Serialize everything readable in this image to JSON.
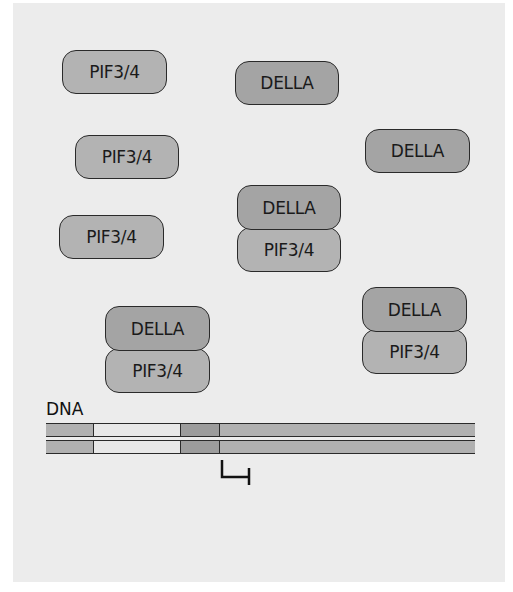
{
  "diagram": {
    "colors": {
      "panel": "#ececec",
      "pif": "#b3b3b3",
      "della": "#a4a4a4",
      "outline": "#2a2a2a",
      "dna_gray": "#b0b0b0",
      "dna_light": "#e8e8e8",
      "dna_dark": "#9c9c9c"
    },
    "free_proteins": [
      {
        "label": "PIF3/4",
        "type": "pif",
        "x": 62,
        "y": 50,
        "w": 105,
        "h": 44
      },
      {
        "label": "DELLA",
        "type": "della",
        "x": 235,
        "y": 61,
        "w": 104,
        "h": 44
      },
      {
        "label": "PIF3/4",
        "type": "pif",
        "x": 75,
        "y": 135,
        "w": 104,
        "h": 44
      },
      {
        "label": "DELLA",
        "type": "della",
        "x": 365,
        "y": 129,
        "w": 105,
        "h": 44
      },
      {
        "label": "PIF3/4",
        "type": "pif",
        "x": 59,
        "y": 215,
        "w": 105,
        "h": 44
      }
    ],
    "complexes": [
      {
        "x": 237,
        "y": 185,
        "w": 104,
        "della": "DELLA",
        "pif": "PIF3/4"
      },
      {
        "x": 105,
        "y": 306,
        "w": 105,
        "della": "DELLA",
        "pif": "PIF3/4"
      },
      {
        "x": 362,
        "y": 287,
        "w": 105,
        "della": "DELLA",
        "pif": "PIF3/4"
      }
    ],
    "dna": {
      "label": "DNA",
      "strands_top": [
        423,
        440
      ],
      "segments": [
        {
          "name": "flank-left",
          "width": 47,
          "shade": "gray"
        },
        {
          "name": "binding-site",
          "width": 87,
          "shade": "light"
        },
        {
          "name": "promoter-core",
          "width": 39,
          "shade": "dark"
        },
        {
          "name": "gene-body",
          "width": 256,
          "shade": "gray"
        }
      ]
    },
    "tss_symbol": "transcription-start-site"
  }
}
